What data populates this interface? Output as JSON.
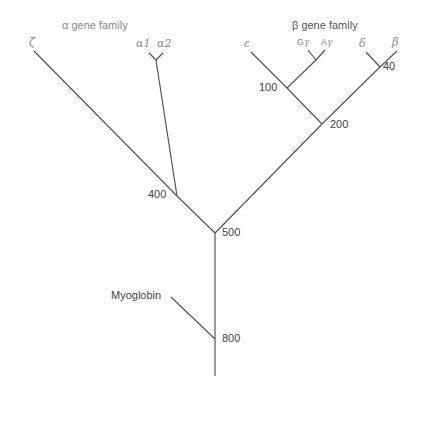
{
  "families": {
    "alpha": {
      "label": "α gene family"
    },
    "beta": {
      "label": "β gene family"
    }
  },
  "leaves": {
    "zeta": "ζ",
    "alpha1": "α1",
    "alpha2": "α2",
    "epsilon": "ε",
    "g_gamma_prefix": "G",
    "g_gamma": "γ",
    "a_gamma_prefix": "A",
    "a_gamma": "γ",
    "delta": "δ",
    "beta": "β",
    "myoglobin": "Myoglobin"
  },
  "nodes": {
    "n40": "40",
    "n100": "100",
    "n200": "200",
    "n400": "400",
    "n500": "500",
    "n800": "800"
  },
  "colors": {
    "line": "#555555",
    "label": "#444444",
    "family_label": "#8a8a8a"
  }
}
